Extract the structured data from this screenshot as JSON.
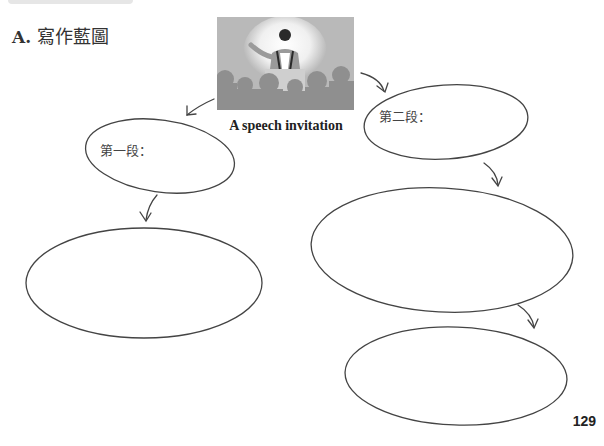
{
  "header": {
    "section_letter": "A.",
    "section_title": "寫作藍圖"
  },
  "image": {
    "icon": "speech-illustration",
    "caption": "A speech invitation"
  },
  "nodes": [
    {
      "id": "paragraph-1",
      "label": "第一段："
    },
    {
      "id": "paragraph-2",
      "label": "第二段："
    },
    {
      "id": "paragraph-1-detail",
      "label": ""
    },
    {
      "id": "paragraph-2-detail",
      "label": ""
    },
    {
      "id": "paragraph-2-detail-2",
      "label": ""
    }
  ],
  "footer": {
    "page_number": "129"
  },
  "colors": {
    "line": "#444444",
    "image_bg": "#b5b5b5",
    "text": "#333333"
  }
}
